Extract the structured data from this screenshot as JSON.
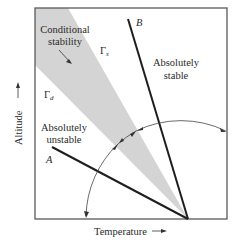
{
  "diagram": {
    "regions": {
      "conditional": [
        "Conditional",
        "stability"
      ],
      "stable": [
        "Absolutely",
        "stable"
      ],
      "unstable": [
        "Absolutely",
        "unstable"
      ]
    },
    "symbols": {
      "gamma_s": "Γ",
      "gamma_s_sub": "s",
      "gamma_d": "Γ",
      "gamma_d_sub": "d"
    },
    "lines": {
      "a": "A",
      "b": "B"
    },
    "axes": {
      "x_label": "Temperature",
      "y_label": "Altitude",
      "arrow": "⟶"
    },
    "colors": {
      "frame": "#5a5a5a",
      "shade": "#d4d4d4",
      "line": "#1e1e1e",
      "text": "#2a2a2a"
    }
  }
}
